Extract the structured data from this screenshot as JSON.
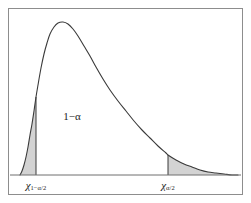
{
  "figure": {
    "background_color": "#ffffff",
    "frame_color": "#8d8d8d",
    "curve_color": "#3a3a3a",
    "fill_color": "#d3d3d3",
    "axis_color": "#6e6e6e"
  },
  "annotations": {
    "confidence_region": {
      "symbol": "1",
      "minus": "−",
      "alpha": "α",
      "full_text": "1−α"
    }
  },
  "axis": {
    "ticks": [
      {
        "name": "lower-critical-value",
        "base": "χ",
        "subscript": "1−α/2",
        "x_px": 36
      },
      {
        "name": "upper-critical-value",
        "base": "χ",
        "subscript": "α/2",
        "x_px": 168
      }
    ]
  },
  "chart_data": {
    "type": "area",
    "title": "",
    "subtitle": "",
    "xlabel": "",
    "ylabel": "",
    "grid": false,
    "legend": null,
    "distribution": "chi-square probability density",
    "xlim": [
      0,
      1
    ],
    "ylim": [
      0,
      1
    ],
    "baseline_y_px": 175,
    "peak": {
      "x_px": 63,
      "y_px": 22
    },
    "curve_start_x_px": 20,
    "curve_end_x_px": 238,
    "curve_points_px": [
      [
        20,
        175
      ],
      [
        22,
        171
      ],
      [
        24,
        165
      ],
      [
        26,
        157
      ],
      [
        28,
        147
      ],
      [
        30,
        135
      ],
      [
        32,
        124
      ],
      [
        34,
        111
      ],
      [
        36,
        97
      ],
      [
        38,
        85
      ],
      [
        41,
        68
      ],
      [
        44,
        54
      ],
      [
        47,
        43
      ],
      [
        50,
        34
      ],
      [
        54,
        27
      ],
      [
        58,
        23
      ],
      [
        63,
        22
      ],
      [
        68,
        24
      ],
      [
        73,
        29
      ],
      [
        78,
        36
      ],
      [
        84,
        46
      ],
      [
        90,
        56
      ],
      [
        96,
        67
      ],
      [
        103,
        79
      ],
      [
        110,
        90
      ],
      [
        118,
        101
      ],
      [
        126,
        111
      ],
      [
        134,
        121
      ],
      [
        142,
        130
      ],
      [
        150,
        138
      ],
      [
        158,
        146
      ],
      [
        166,
        153
      ],
      [
        168,
        155
      ],
      [
        176,
        160
      ],
      [
        184,
        164
      ],
      [
        192,
        167
      ],
      [
        200,
        170
      ],
      [
        208,
        172
      ],
      [
        216,
        173
      ],
      [
        224,
        174
      ],
      [
        232,
        175
      ],
      [
        238,
        175
      ]
    ],
    "regions": [
      {
        "name": "lower-tail",
        "label": "α/2",
        "x_from_px": 20,
        "x_to_px": 36,
        "shaded": true,
        "fill": "#d3d3d3"
      },
      {
        "name": "central-region",
        "label": "1−α",
        "x_from_px": 36,
        "x_to_px": 168,
        "shaded": false,
        "fill": "#ffffff"
      },
      {
        "name": "upper-tail",
        "label": "α/2",
        "x_from_px": 168,
        "x_to_px": 238,
        "shaded": true,
        "fill": "#d3d3d3"
      }
    ],
    "vertical_boundaries": [
      {
        "name": "lower-boundary",
        "x_px": 36,
        "y_top_px": 97,
        "y_bottom_px": 175
      },
      {
        "name": "upper-boundary",
        "x_px": 168,
        "y_top_px": 155,
        "y_bottom_px": 175
      }
    ]
  }
}
